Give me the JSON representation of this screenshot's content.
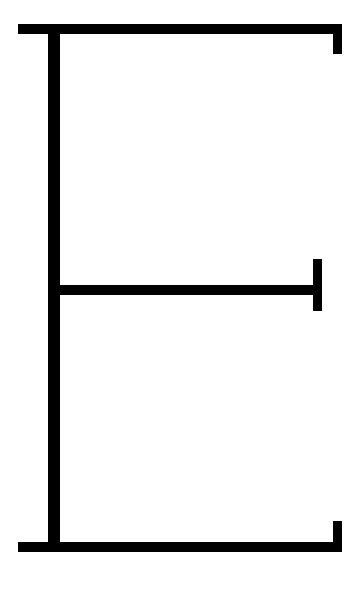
{
  "diagram": {
    "description": "Black line glyph resembling a stylized letter E on a white background",
    "background_color": "#ffffff",
    "stroke_color": "#000000",
    "shapes": [
      {
        "name": "top-bar",
        "type": "horizontal-line",
        "x": 18,
        "y": 24,
        "width": 324,
        "height": 10
      },
      {
        "name": "spine",
        "type": "vertical-line",
        "x": 48,
        "y": 24,
        "width": 12,
        "height": 528
      },
      {
        "name": "top-tick",
        "type": "vertical-line",
        "x": 333,
        "y": 24,
        "width": 9,
        "height": 30
      },
      {
        "name": "mid-bar",
        "type": "horizontal-line",
        "x": 55,
        "y": 285,
        "width": 264,
        "height": 10
      },
      {
        "name": "mid-tick",
        "type": "vertical-line",
        "x": 313,
        "y": 259,
        "width": 9,
        "height": 52
      },
      {
        "name": "bottom-bar",
        "type": "horizontal-line",
        "x": 18,
        "y": 542,
        "width": 324,
        "height": 10
      },
      {
        "name": "bottom-tick",
        "type": "vertical-line",
        "x": 333,
        "y": 521,
        "width": 9,
        "height": 31
      }
    ]
  }
}
